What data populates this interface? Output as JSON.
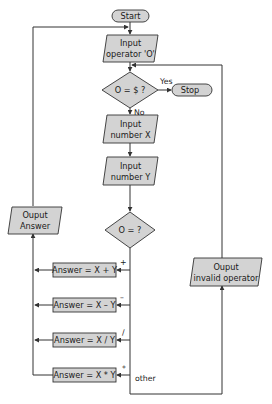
{
  "diagram": {
    "type": "flowchart",
    "nodes": {
      "start": {
        "shape": "terminator",
        "label": "Start"
      },
      "input_operator": {
        "shape": "parallelogram",
        "lines": [
          "Input",
          "operator 'O'"
        ]
      },
      "decision_stop": {
        "shape": "diamond",
        "label": "O = $ ?"
      },
      "stop": {
        "shape": "terminator",
        "label": "Stop"
      },
      "input_x": {
        "shape": "parallelogram",
        "lines": [
          "Input",
          "number X"
        ]
      },
      "input_y": {
        "shape": "parallelogram",
        "lines": [
          "Input",
          "number Y"
        ]
      },
      "decision_op": {
        "shape": "diamond",
        "label": "O = ?"
      },
      "answer_add": {
        "shape": "process",
        "label": "Answer = X + Y"
      },
      "answer_sub": {
        "shape": "process",
        "label": "Answer = X – Y"
      },
      "answer_div": {
        "shape": "process",
        "label": "Answer = X / Y"
      },
      "answer_mul": {
        "shape": "process",
        "label": "Answer = X * Y"
      },
      "output_answer": {
        "shape": "parallelogram",
        "lines": [
          "Ouput",
          "Answer"
        ]
      },
      "output_invalid": {
        "shape": "parallelogram",
        "lines": [
          "Ouput",
          "invalid operator"
        ]
      }
    },
    "edge_labels": {
      "yes": "Yes",
      "no": "No",
      "plus": "+",
      "minus": "–",
      "divide": "/",
      "multiply": "*",
      "other": "other"
    },
    "edges": [
      {
        "from": "start",
        "to": "input_operator"
      },
      {
        "from": "input_operator",
        "to": "decision_stop"
      },
      {
        "from": "decision_stop",
        "to": "stop",
        "label": "Yes"
      },
      {
        "from": "decision_stop",
        "to": "input_x",
        "label": "No"
      },
      {
        "from": "input_x",
        "to": "input_y"
      },
      {
        "from": "input_y",
        "to": "decision_op"
      },
      {
        "from": "decision_op",
        "to": "answer_add",
        "label": "+"
      },
      {
        "from": "decision_op",
        "to": "answer_sub",
        "label": "–"
      },
      {
        "from": "decision_op",
        "to": "answer_div",
        "label": "/"
      },
      {
        "from": "decision_op",
        "to": "answer_mul",
        "label": "*"
      },
      {
        "from": "decision_op",
        "to": "output_invalid",
        "label": "other"
      },
      {
        "from": "answer_add",
        "to": "output_answer"
      },
      {
        "from": "answer_sub",
        "to": "output_answer"
      },
      {
        "from": "answer_div",
        "to": "output_answer"
      },
      {
        "from": "answer_mul",
        "to": "output_answer"
      },
      {
        "from": "output_answer",
        "to": "input_operator"
      },
      {
        "from": "output_invalid",
        "to": "input_operator"
      }
    ],
    "colors": {
      "shape_fill": "#d3d3d3",
      "stroke": "#333333",
      "background": "#ffffff"
    }
  }
}
